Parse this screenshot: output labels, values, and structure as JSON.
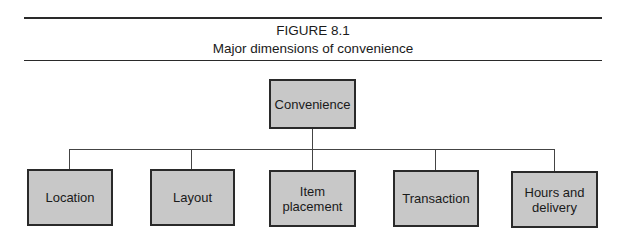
{
  "figure": {
    "number": "FIGURE 8.1",
    "title": "Major dimensions of convenience"
  },
  "diagram": {
    "root": {
      "label": "Convenience"
    },
    "children": [
      {
        "label": "Location"
      },
      {
        "label": "Layout"
      },
      {
        "label": "Item placement"
      },
      {
        "label": "Transaction"
      },
      {
        "label": "Hours and delivery"
      }
    ]
  },
  "colors": {
    "box_fill": "#c8c8c8",
    "box_border": "#2a2a2a",
    "line": "#444444"
  }
}
